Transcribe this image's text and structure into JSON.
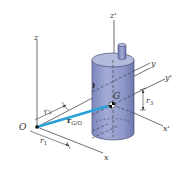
{
  "figure": {
    "colors": {
      "background": "#ffffff",
      "axis_line": "#4a4a4a",
      "cylinder_fill": "#8f98c9",
      "cylinder_top": "#b3badc",
      "cylinder_edge": "#4a4f7a",
      "position_vector": "#2aa0d8"
    },
    "labels": {
      "origin": "O",
      "z_axis": "z",
      "z_prime_axis": "z'",
      "x_axis": "x",
      "y_axis": "y",
      "x_prime_axis": "x'",
      "y_prime_axis": "y'",
      "center": "G",
      "r1": "r",
      "r1_sub": "1",
      "r2": "r",
      "r2_sub": "2",
      "r3": "r",
      "r3_sub": "3",
      "r_vector": "r",
      "r_vector_sub": "G/O"
    }
  }
}
